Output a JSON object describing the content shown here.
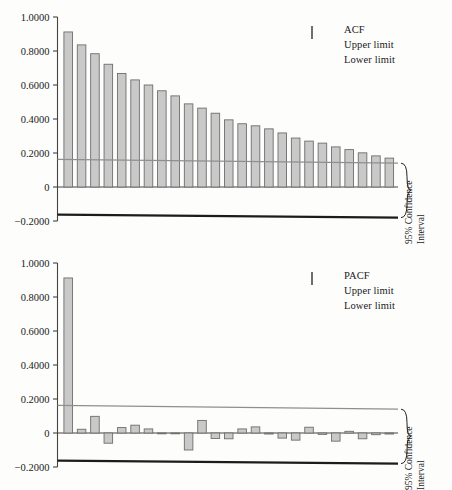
{
  "figure": {
    "background": "#fdfdfc",
    "bar_fill": "#c9c9c9",
    "bar_stroke": "#6e6e6e",
    "upper_limit_color": "#8f8f8f",
    "lower_limit_color": "#1c1c1c",
    "axis_color": "#444444"
  },
  "annotations": {
    "ci_line1": "95% Confidence",
    "ci_line2": "Interval"
  },
  "chart_data": [
    {
      "type": "bar",
      "id": "acf",
      "title": "",
      "xlabel": "",
      "ylabel": "",
      "ylim": [
        -0.2,
        1.0
      ],
      "yticks": [
        1.0,
        0.8,
        0.6,
        0.4,
        0.2,
        0.0,
        -0.2
      ],
      "ytick_labels": [
        "1.0000",
        "0.8000",
        "0.6000",
        "0.4000",
        "0.2000",
        "0",
        "-0.2000"
      ],
      "grid": false,
      "legend": {
        "position": "top-right",
        "entries": [
          {
            "label": "ACF",
            "key": "bar-swatch"
          },
          {
            "label": "Upper limit",
            "key": "upper-line"
          },
          {
            "label": "Lower limit",
            "key": "lower-line"
          }
        ]
      },
      "categories": [
        1,
        2,
        3,
        4,
        5,
        6,
        7,
        8,
        9,
        10,
        11,
        12,
        13,
        14,
        15,
        16,
        17,
        18,
        19,
        20,
        21,
        22,
        23,
        24,
        25
      ],
      "values": [
        0.912,
        0.836,
        0.784,
        0.722,
        0.668,
        0.63,
        0.6,
        0.566,
        0.536,
        0.489,
        0.464,
        0.434,
        0.395,
        0.372,
        0.36,
        0.342,
        0.318,
        0.288,
        0.27,
        0.258,
        0.236,
        0.22,
        0.201,
        0.183,
        0.17
      ],
      "upper_limit": {
        "start": 0.162,
        "end": 0.14
      },
      "lower_limit": {
        "start": -0.162,
        "end": -0.18
      }
    },
    {
      "type": "bar",
      "id": "pacf",
      "title": "",
      "xlabel": "",
      "ylabel": "",
      "ylim": [
        -0.2,
        1.0
      ],
      "yticks": [
        1.0,
        0.8,
        0.6,
        0.4,
        0.2,
        0.0,
        -0.2
      ],
      "ytick_labels": [
        "1.0000",
        "0.8000",
        "0.6000",
        "0.4000",
        "0.2000",
        "0",
        "-0.2000"
      ],
      "grid": false,
      "legend": {
        "position": "top-right",
        "entries": [
          {
            "label": "PACF",
            "key": "bar-swatch"
          },
          {
            "label": "Upper limit",
            "key": "upper-line"
          },
          {
            "label": "Lower limit",
            "key": "lower-line"
          }
        ]
      },
      "categories": [
        1,
        2,
        3,
        4,
        5,
        6,
        7,
        8,
        9,
        10,
        11,
        12,
        13,
        14,
        15,
        16,
        17,
        18,
        19,
        20,
        21,
        22,
        23,
        24,
        25
      ],
      "values": [
        0.912,
        0.022,
        0.098,
        -0.06,
        0.032,
        0.046,
        0.024,
        -0.004,
        -0.004,
        -0.1,
        0.074,
        -0.032,
        -0.034,
        0.024,
        0.036,
        -0.006,
        -0.03,
        -0.042,
        0.034,
        -0.008,
        -0.048,
        0.01,
        -0.034,
        -0.01,
        -0.006
      ],
      "upper_limit": {
        "start": 0.162,
        "end": 0.14
      },
      "lower_limit": {
        "start": -0.162,
        "end": -0.18
      }
    }
  ]
}
